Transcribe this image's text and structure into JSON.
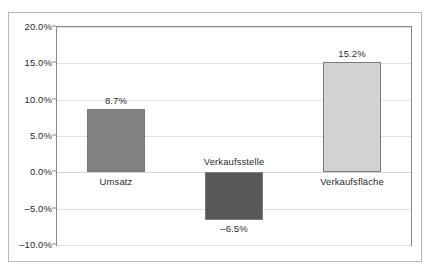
{
  "figure": {
    "crop_remnant_text": "                                                                  ",
    "background_color": "#ffffff",
    "frame_color": "#b9b9b9",
    "axis_color": "#8a8a8a",
    "gridline_color": "#e2e2e2"
  },
  "chart_data": {
    "type": "bar",
    "title": "",
    "subtitle": "",
    "xlabel": "",
    "ylabel": "",
    "categories": [
      "Umsatz",
      "Verkaufsstelle",
      "Verkaufsfläche"
    ],
    "values": [
      8.7,
      -6.5,
      15.2
    ],
    "value_labels": [
      "8.7%",
      "-6.5%",
      "15.2%"
    ],
    "bar_colors": [
      "#828282",
      "#585858",
      "#d2d2d2"
    ],
    "bar_border_color": "#7b7b7b",
    "ylim": [
      -10.0,
      20.0
    ],
    "ytick_values": [
      20.0,
      15.0,
      10.0,
      5.0,
      0.0,
      -5.0,
      -10.0
    ],
    "ytick_labels": [
      "20.0%",
      "15.0%",
      "10.0%",
      "5.0%",
      "0.0%",
      "-5.0%",
      "-10.0%"
    ],
    "grid": true,
    "grid_axis": "y",
    "legend": false,
    "legend_position": "none",
    "zero_line": 0.0,
    "annotations": [
      {
        "text": "8.7%",
        "category": "Umsatz",
        "position": "above-bar"
      },
      {
        "text": "Umsatz",
        "category": "Umsatz",
        "position": "below-zero"
      },
      {
        "text": "Verkaufsstelle",
        "category": "Verkaufsstelle",
        "position": "above-zero"
      },
      {
        "text": "-6.5%",
        "category": "Verkaufsstelle",
        "position": "below-bar"
      },
      {
        "text": "15.2%",
        "category": "Verkaufsfläche",
        "position": "above-bar"
      },
      {
        "text": "Verkaufsfläche",
        "category": "Verkaufsfläche",
        "position": "below-zero"
      }
    ]
  }
}
